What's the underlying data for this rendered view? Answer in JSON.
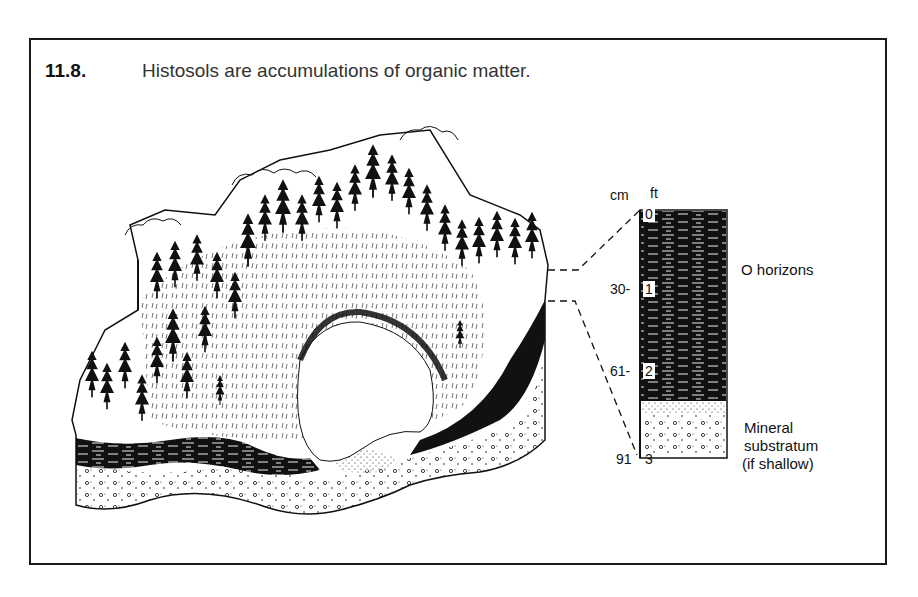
{
  "figure": {
    "number": "11.8.",
    "title": "Histosols are accumulations of organic matter."
  },
  "profile": {
    "units": {
      "metric": "cm",
      "imperial": "ft"
    },
    "ticks": [
      {
        "cm": "",
        "ft": "0"
      },
      {
        "cm": "30-",
        "ft": "1"
      },
      {
        "cm": "61-",
        "ft": "2"
      },
      {
        "cm": "91",
        "ft": "3"
      }
    ],
    "horizons": [
      {
        "label": "O horizons"
      },
      {
        "label_lines": [
          "Mineral",
          "substratum",
          "(if shallow)"
        ]
      }
    ]
  },
  "illustration": {
    "subject": "block-diagram-bog-with-conifer-forest",
    "colors": {
      "ink": "#111111",
      "paper": "#ffffff"
    }
  }
}
